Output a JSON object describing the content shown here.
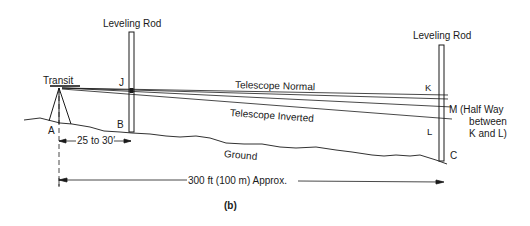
{
  "figure": {
    "caption": "(b)",
    "rod_left_label": "Leveling Rod",
    "rod_right_label": "Leveling Rod",
    "transit_label": "Transit",
    "point_labels": {
      "A": "A",
      "B": "B",
      "C": "C",
      "J": "J",
      "K": "K",
      "L": "L",
      "M": "M"
    },
    "m_note_line1": "(Half Way",
    "m_note_line2": "between",
    "m_note_line3": "K and L)",
    "sight_line_normal": "Telescope Normal",
    "sight_line_inverted": "Telescope Inverted",
    "ground_label": "Ground",
    "short_dimension": "25 to 30′",
    "long_dimension": "300 ft (100 m) Approx."
  },
  "colors": {
    "ink": "#1a1a1a",
    "background": "#ffffff"
  }
}
